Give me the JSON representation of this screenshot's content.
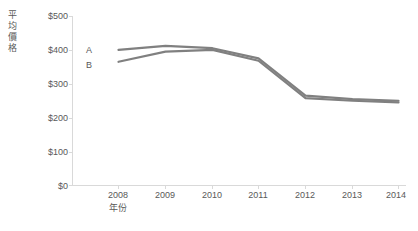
{
  "chart_data": {
    "type": "line",
    "title": "",
    "xlabel": "年份",
    "ylabel": "平均價格",
    "x": [
      "2008",
      "2009",
      "2010",
      "2011",
      "2012",
      "2013",
      "2014"
    ],
    "categories": [
      "2008",
      "2009",
      "2010",
      "2011",
      "2012",
      "2013",
      "2014"
    ],
    "series": [
      {
        "name": "A",
        "color": "#808080",
        "values": [
          400,
          412,
          405,
          375,
          265,
          255,
          250
        ]
      },
      {
        "name": "B",
        "color": "#808080",
        "values": [
          365,
          395,
          400,
          368,
          258,
          250,
          245
        ]
      }
    ],
    "ylim": [
      0,
      500
    ],
    "ytick_values": [
      0,
      100,
      200,
      300,
      400,
      500
    ],
    "ytick_labels": [
      "$0",
      "$100",
      "$200",
      "$300",
      "$400",
      "$500"
    ],
    "xtick_labels": [
      "2008",
      "2009",
      "2010",
      "2011",
      "2012",
      "2013",
      "2014"
    ],
    "grid": false,
    "legend": "inline-series-labels",
    "axis_color": "#d9d9d9",
    "text_color": "#595959",
    "background": "#ffffff"
  },
  "axes": {
    "y_title_chars": [
      "平",
      "均",
      "價",
      "格"
    ],
    "x_title": "年份"
  },
  "series_labels": [
    {
      "text": "A"
    },
    {
      "text": "B"
    }
  ]
}
